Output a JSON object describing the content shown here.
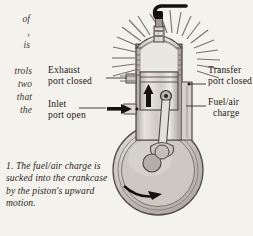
{
  "page": {
    "background_color": "#f4f2ec",
    "ink_color": "#241f1c"
  },
  "margin_text_fragments": [
    {
      "text": "of"
    },
    {
      "text": ","
    },
    {
      "text": "is"
    },
    {
      "text": "trols"
    },
    {
      "text": "two"
    },
    {
      "text": "that"
    },
    {
      "text": "the"
    }
  ],
  "labels": {
    "exhaust_line1": "Exhaust",
    "exhaust_line2": "port closed",
    "inlet_line1": "Inlet",
    "inlet_line2": "port open",
    "transfer_line1": "Transfer",
    "transfer_line2": "port closed",
    "fuelair_line1": "Fuel/air",
    "fuelair_line2": "charge"
  },
  "caption": {
    "number": "1.",
    "text": "The fuel/air charge is sucked into the crankcase by the piston's upward motion.",
    "full": "1. The fuel/air charge is sucked into the crankcase by the piston's upward motion."
  },
  "diagram": {
    "parts": [
      "spark-plug",
      "spark-plug-lead",
      "cylinder-head",
      "cooling-fins",
      "combustion-chamber",
      "piston",
      "piston-rings",
      "wrist-pin",
      "connecting-rod",
      "crankshaft",
      "crankcase",
      "exhaust-port",
      "inlet-port",
      "transfer-passage"
    ],
    "arrows": {
      "piston_direction": "up",
      "inlet_flow_direction": "right",
      "crank_rotation": "clockwise"
    },
    "colors": {
      "metal_light": "#e3e0da",
      "metal_mid": "#b9b5ae",
      "metal_dark": "#8e8a83",
      "outline": "#4a4540",
      "arrow": "#15110f"
    }
  }
}
